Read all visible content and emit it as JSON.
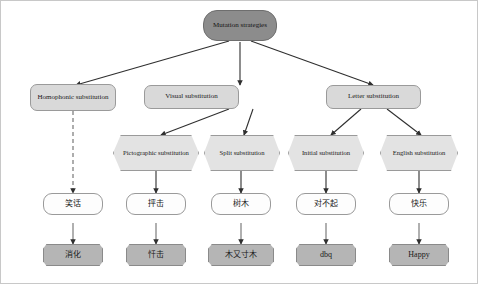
{
  "diagram": {
    "colors": {
      "root_fill": "#8c8c8c",
      "category_fill": "#d9d9d9",
      "hexagon_fill": "#e3e3e3",
      "example_fill": "#fdfdfd",
      "result_fill": "#b5b5b5",
      "edge": "#3a3a3a",
      "background": "#ffffff"
    },
    "root": {
      "label": "Mutation strategies"
    },
    "categories": [
      {
        "id": "homophonic",
        "label": "Homophonic substitution"
      },
      {
        "id": "visual",
        "label": "Visual substitution"
      },
      {
        "id": "letter",
        "label": "Letter substitution"
      }
    ],
    "subcategories": [
      {
        "id": "pictographic",
        "label": "Pictographic substitution",
        "parent": "visual"
      },
      {
        "id": "split",
        "label": "Split substitution",
        "parent": "visual"
      },
      {
        "id": "initial",
        "label": "Initial substitution",
        "parent": "letter"
      },
      {
        "id": "english",
        "label": "English substitution",
        "parent": "letter"
      }
    ],
    "examples": [
      {
        "id": "ex-homophonic",
        "label": "笑话"
      },
      {
        "id": "ex-pictographic",
        "label": "抨击"
      },
      {
        "id": "ex-split",
        "label": "树木"
      },
      {
        "id": "ex-initial",
        "label": "对不起"
      },
      {
        "id": "ex-english",
        "label": "快乐"
      }
    ],
    "results": [
      {
        "id": "res-homophonic",
        "label": "消化"
      },
      {
        "id": "res-pictographic",
        "label": "忏击"
      },
      {
        "id": "res-split",
        "label": "木又寸木"
      },
      {
        "id": "res-initial",
        "label": "dbq"
      },
      {
        "id": "res-english",
        "label": "Happy"
      }
    ],
    "edge_styles": {
      "solid": "solid",
      "dashed": "dashed"
    }
  }
}
